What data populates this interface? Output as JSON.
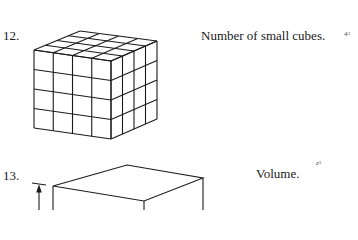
{
  "problems": [
    {
      "number": "12.",
      "caption": "Number of small cubes.",
      "answer_base": "4",
      "answer_exponent": "3",
      "figure": "cube-4x4x4-grid"
    },
    {
      "number": "13.",
      "caption": "Volume.",
      "answer_base": "z",
      "answer_exponent": "3",
      "figure": "rectangular-box-with-dimension-arrow"
    }
  ]
}
